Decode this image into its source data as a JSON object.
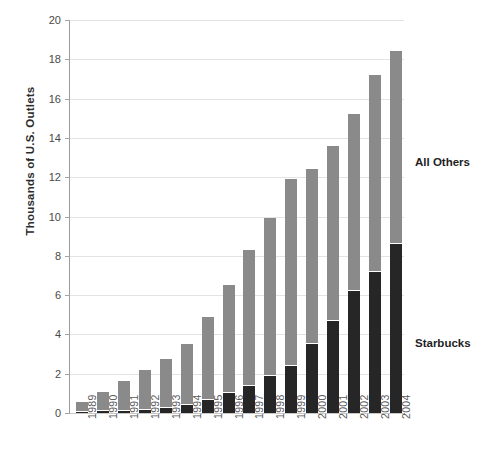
{
  "chart_data": {
    "type": "bar",
    "subtype": "stacked-bar",
    "title": "",
    "xlabel": "",
    "ylabel": "Thousands of U.S. Outlets",
    "ylim": [
      0,
      20
    ],
    "ytick_step": 2,
    "yticks": [
      0,
      2,
      4,
      6,
      8,
      10,
      12,
      14,
      16,
      18,
      20
    ],
    "grid": true,
    "legend_position": "right-inline-annotations",
    "categories": [
      "1989",
      "1990",
      "1991",
      "1992",
      "1993",
      "1994",
      "1995",
      "1996",
      "1997",
      "1998",
      "1999",
      "2000",
      "2001",
      "2002",
      "2003",
      "2004"
    ],
    "series": [
      {
        "name": "Starbucks",
        "color": "#262626",
        "values": [
          0.05,
          0.08,
          0.12,
          0.17,
          0.27,
          0.43,
          0.68,
          1.0,
          1.4,
          1.9,
          2.4,
          3.5,
          4.7,
          6.2,
          7.2,
          8.6
        ]
      },
      {
        "name": "All Others",
        "color": "#8a8a8a",
        "values": [
          0.5,
          1.0,
          1.5,
          2.0,
          2.5,
          3.1,
          4.2,
          5.5,
          6.9,
          8.0,
          9.5,
          8.9,
          8.9,
          9.0,
          10.0,
          9.8
        ]
      }
    ],
    "totals": [
      0.55,
      1.08,
      1.62,
      2.17,
      2.77,
      3.53,
      4.88,
      6.5,
      8.3,
      9.9,
      11.9,
      12.4,
      13.6,
      15.2,
      17.2,
      18.4
    ],
    "annotations": [
      {
        "name": "All Others",
        "text": "All Others"
      },
      {
        "name": "Starbucks",
        "text": "Starbucks"
      }
    ]
  },
  "colors": {
    "background": "#ffffff",
    "axis": "#9b9b9b",
    "grid": "#e3e3e3",
    "starbucks": "#262626",
    "all_others": "#8a8a8a",
    "text": "#3a3a3a"
  }
}
